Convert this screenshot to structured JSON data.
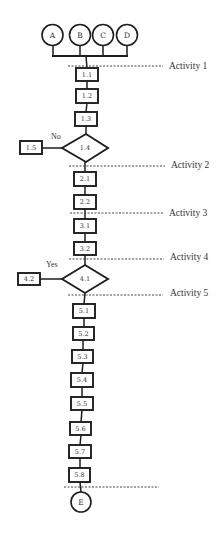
{
  "diagram": {
    "start_nodes": {
      "a": "A",
      "b": "B",
      "c": "C",
      "d": "D"
    },
    "end_node": "E",
    "activities": {
      "a1": "Activity 1",
      "a2": "Activity 2",
      "a3": "Activity 3",
      "a4": "Activity 4",
      "a5": "Activity 5"
    },
    "nodes": {
      "n1_1": "1.1",
      "n1_2": "1.2",
      "n1_3": "1.3",
      "n1_4": "1.4",
      "n1_5": "1.5",
      "n2_1": "2.1",
      "n2_2": "2.2",
      "n3_1": "3.1",
      "n3_2": "3.2",
      "n4_1": "4.1",
      "n4_2": "4.2",
      "n5_1": "5.1",
      "n5_2": "5.2",
      "n5_3": "5.3",
      "n5_4": "5.4",
      "n5_5": "5.5",
      "n5_6": "5.6",
      "n5_7": "5.7",
      "n5_8": "5.8"
    },
    "decisions": {
      "n1_4": {
        "branch_label": "No",
        "branch_to": "1.5"
      },
      "n4_1": {
        "branch_label": "Yes",
        "branch_to": "4.2"
      }
    }
  }
}
